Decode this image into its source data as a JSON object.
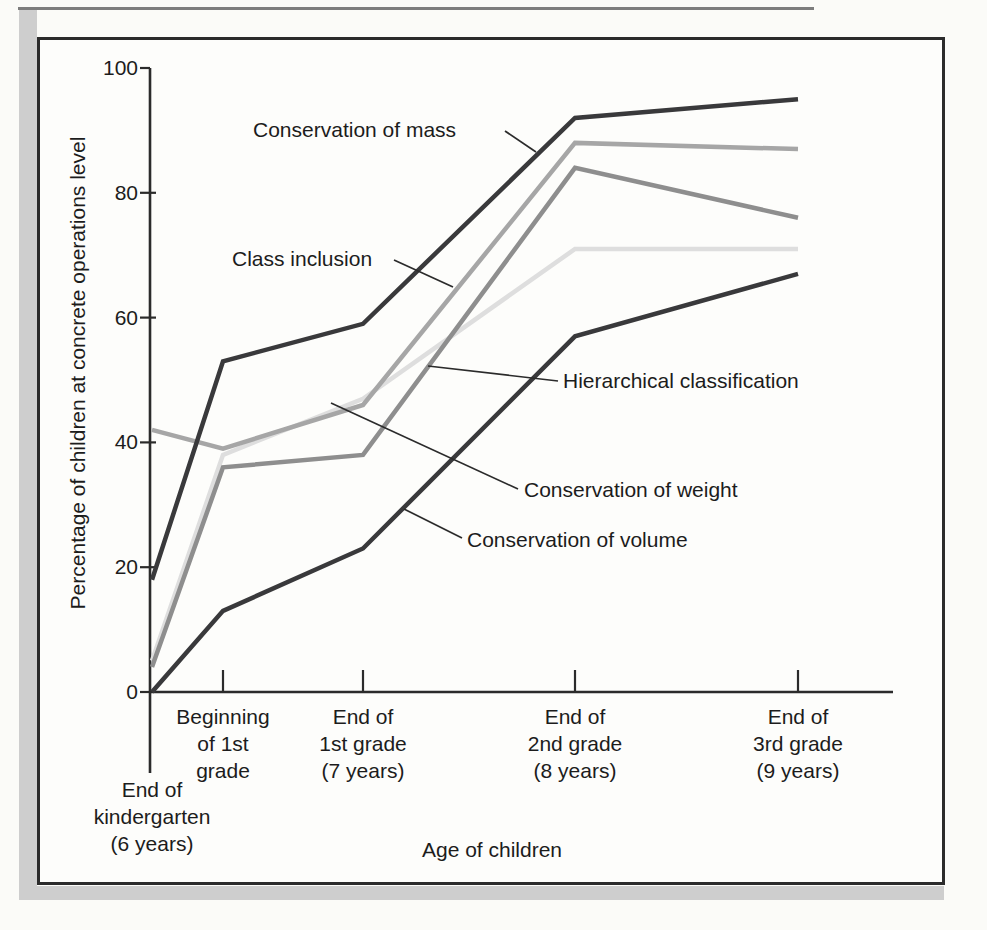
{
  "page": {
    "background": "#fbfbf8",
    "shadow_color": "#cecece",
    "border_color": "#2b2b2b",
    "text_color": "#1c1c1c"
  },
  "chart_data": {
    "type": "line",
    "title": "",
    "xlabel": "Age of children",
    "ylabel": "Percentage of children at concrete operations level",
    "ylim": [
      0,
      100
    ],
    "yticks": [
      0,
      20,
      40,
      60,
      80,
      100
    ],
    "grid": false,
    "legend_style": "inline-annotations-with-leader-lines",
    "categories": [
      "End of kindergarten (6 years)",
      "Beginning of 1st grade",
      "End of 1st grade (7 years)",
      "End of 2nd grade (8 years)",
      "End of 3rd grade (9 years)"
    ],
    "categories_lines": [
      [
        "End of",
        "kindergarten",
        "(6 years)"
      ],
      [
        "Beginning",
        "of 1st",
        "grade"
      ],
      [
        "End of",
        "1st grade",
        "(7 years)"
      ],
      [
        "End of",
        "2nd grade",
        "(8 years)"
      ],
      [
        "End of",
        "3rd grade",
        "(9 years)"
      ]
    ],
    "series": [
      {
        "name": "Conservation of mass",
        "color": "#39393b",
        "values": [
          18,
          53,
          59,
          92,
          95
        ]
      },
      {
        "name": "Class inclusion",
        "color": "#a6a6a6",
        "values": [
          42,
          39,
          46,
          88,
          87
        ]
      },
      {
        "name": "Hierarchical classification",
        "color": "#8e8e8e",
        "values": [
          4,
          36,
          38,
          84,
          76
        ]
      },
      {
        "name": "Conservation of weight",
        "color": "#dedede",
        "values": [
          5,
          38,
          47,
          71,
          71
        ]
      },
      {
        "name": "Conservation of volume",
        "color": "#39393b",
        "values": [
          0,
          13,
          23,
          57,
          67
        ]
      }
    ]
  }
}
